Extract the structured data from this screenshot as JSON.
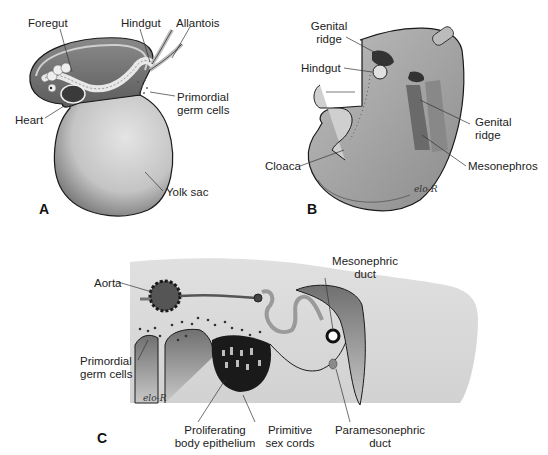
{
  "figure": {
    "panels": [
      {
        "id": "A",
        "letter": "A",
        "labels": {
          "foregut": "Foregut",
          "hindgut": "Hindgut",
          "allantois": "Allantois",
          "primordial_1": "Primordial",
          "primordial_2": "germ cells",
          "heart": "Heart",
          "yolk_sac": "Yolk sac"
        }
      },
      {
        "id": "B",
        "letter": "B",
        "labels": {
          "genital_ridge_top_1": "Genital",
          "genital_ridge_top_2": "ridge",
          "hindgut": "Hindgut",
          "genital_ridge_right_1": "Genital",
          "genital_ridge_right_2": "ridge",
          "cloaca": "Cloaca",
          "mesonephros": "Mesonephros"
        },
        "signature": "elo-R"
      },
      {
        "id": "C",
        "letter": "C",
        "labels": {
          "aorta": "Aorta",
          "mesonephric_1": "Mesonephric",
          "mesonephric_2": "duct",
          "primordial_1": "Primordial",
          "primordial_2": "germ cells",
          "proliferating_1": "Proliferating",
          "proliferating_2": "body epithelium",
          "primitive_1": "Primitive",
          "primitive_2": "sex cords",
          "paramesonephric_1": "Paramesonephric",
          "paramesonephric_2": "duct"
        },
        "signature": "elo-R"
      }
    ],
    "colors": {
      "tissue_light": "#d9d9d9",
      "tissue_mid": "#a8a8a8",
      "tissue_dark": "#6e6e6e",
      "outline": "#1a1a1a",
      "label_text": "#222222"
    }
  }
}
